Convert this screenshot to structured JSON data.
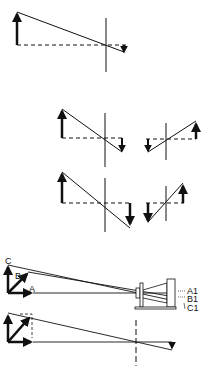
{
  "diagram": {
    "colors": {
      "stroke": "#111111",
      "background": "#ffffff"
    },
    "panels": [
      {
        "name": "single-object-inversion"
      },
      {
        "name": "object-positions-row-1"
      },
      {
        "name": "object-positions-row-2"
      },
      {
        "name": "camera-projection-abc"
      },
      {
        "name": "vector-projection"
      }
    ],
    "labels": {
      "a": "A",
      "b": "B",
      "c": "C",
      "a1": "A1",
      "b1": "B1",
      "c1": "C1"
    }
  }
}
